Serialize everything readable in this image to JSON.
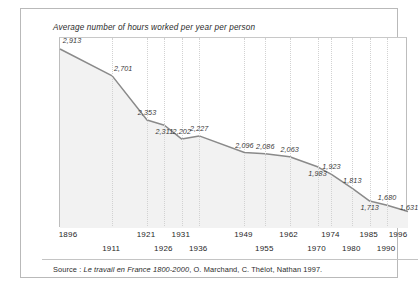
{
  "card": {
    "title": "Average number of hours worked per year per person",
    "source_prefix": "Source : ",
    "source_title": "Le travail en France 1800-2000",
    "source_rest": ", O. Marchand, C. Thélot, Nathan 1997."
  },
  "colors": {
    "line": "#8a8a8a",
    "fill": "#f2f2f2",
    "grid": "#d2d2d2",
    "frame": "#bdbdbd",
    "card_border": "#b9b9b9",
    "text": "#2b2b2b",
    "label": "#3a3a3a"
  },
  "chart_data": {
    "type": "line",
    "title": "Average number of hours worked per year per person",
    "xlabel": "",
    "ylabel": "",
    "grid": "vertical-dotted",
    "legend": "none",
    "ylim": [
      1500,
      3000
    ],
    "categories": [
      "1896",
      "1911",
      "1921",
      "1926",
      "1931",
      "1936",
      "1949",
      "1955",
      "1962",
      "1970",
      "1974",
      "1980",
      "1985",
      "1990",
      "1996"
    ],
    "x": [
      1896,
      1911,
      1921,
      1926,
      1931,
      1936,
      1949,
      1955,
      1962,
      1970,
      1974,
      1980,
      1985,
      1990,
      1996
    ],
    "values": [
      2913,
      2701,
      2353,
      2311,
      2202,
      2227,
      2096,
      2086,
      2063,
      1983,
      1923,
      1813,
      1713,
      1680,
      1631
    ],
    "point_labels": [
      "2,913",
      "2,701",
      "2,353",
      "2,311",
      "2,202",
      "2,227",
      "2,096",
      "2,086",
      "2,063",
      "1,983",
      "1,923",
      "1,813",
      "1,713",
      "1,680",
      "1,631"
    ],
    "tick_rows": [
      0,
      1,
      0,
      1,
      0,
      1,
      0,
      1,
      0,
      1,
      0,
      1,
      0,
      1,
      0
    ]
  }
}
